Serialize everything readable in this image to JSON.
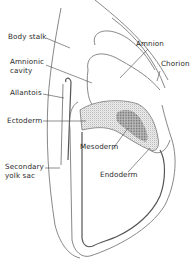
{
  "figure": {
    "type": "embryo cross-section diagram",
    "labels": [
      {
        "id": "body-stalk",
        "text": "Body stalk"
      },
      {
        "id": "amnion",
        "text": "Amnion"
      },
      {
        "id": "chorion",
        "text": "Chorion"
      },
      {
        "id": "amnionic-cavity-1",
        "text": "Amnionic"
      },
      {
        "id": "amnionic-cavity-2",
        "text": "cavity"
      },
      {
        "id": "allantois",
        "text": "Allantois"
      },
      {
        "id": "ectoderm",
        "text": "Ectoderm"
      },
      {
        "id": "mesoderm",
        "text": "Mesoderm"
      },
      {
        "id": "endoderm",
        "text": "Endoderm"
      },
      {
        "id": "secondary-yolk-sac-1",
        "text": "Secondary"
      },
      {
        "id": "secondary-yolk-sac-2",
        "text": "yolk sac"
      }
    ],
    "colors": {
      "line": "#6a6a6a",
      "stipple": "#9a9a9a",
      "text": "#2a2a2a"
    }
  }
}
